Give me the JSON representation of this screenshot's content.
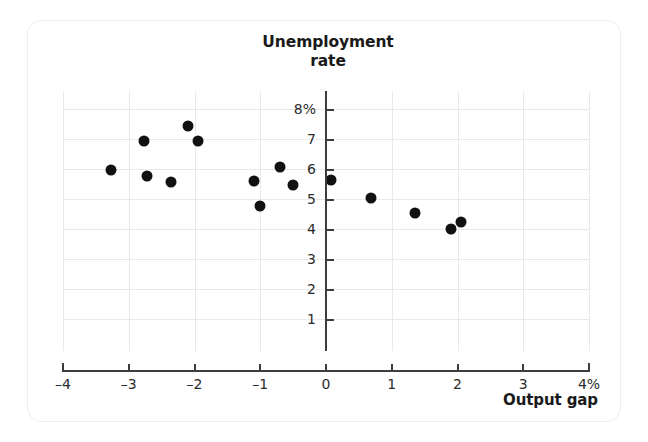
{
  "chart_data": {
    "type": "scatter",
    "title": "Unemployment rate",
    "title_lines": [
      "Unemployment",
      "rate"
    ],
    "xlabel": "Output gap",
    "ylabel": "Unemployment rate",
    "xlim": [
      -4,
      4
    ],
    "ylim": [
      0,
      8.6
    ],
    "grid": true,
    "legend": "none",
    "x_ticks": [
      -4,
      -3,
      -2,
      -1,
      0,
      1,
      2,
      3,
      4
    ],
    "x_tick_labels": [
      "–4",
      "–3",
      "–2",
      "–1",
      "0",
      "1",
      "2",
      "3",
      "4%"
    ],
    "y_ticks": [
      1,
      2,
      3,
      4,
      5,
      6,
      7,
      8
    ],
    "y_tick_labels": [
      "1",
      "2",
      "3",
      "4",
      "5",
      "6",
      "7",
      "8%"
    ],
    "x_unit": "%",
    "y_unit": "%",
    "points": [
      {
        "x": -3.27,
        "y": 5.97
      },
      {
        "x": -2.77,
        "y": 6.95
      },
      {
        "x": -2.72,
        "y": 5.78
      },
      {
        "x": -2.35,
        "y": 5.58
      },
      {
        "x": -2.1,
        "y": 7.45
      },
      {
        "x": -1.95,
        "y": 6.93
      },
      {
        "x": -1.1,
        "y": 5.6
      },
      {
        "x": -1.0,
        "y": 4.78
      },
      {
        "x": -0.7,
        "y": 6.08
      },
      {
        "x": -0.5,
        "y": 5.47
      },
      {
        "x": 0.08,
        "y": 5.62
      },
      {
        "x": 0.68,
        "y": 5.02
      },
      {
        "x": 1.35,
        "y": 4.52
      },
      {
        "x": 1.9,
        "y": 4.0
      },
      {
        "x": 2.05,
        "y": 4.23
      }
    ]
  },
  "style": {
    "dot_color": "#111111",
    "grid_color": "#e9e9e9",
    "axis_color": "#3d3d3d",
    "card_border_color": "#ededed",
    "background": "#ffffff"
  }
}
